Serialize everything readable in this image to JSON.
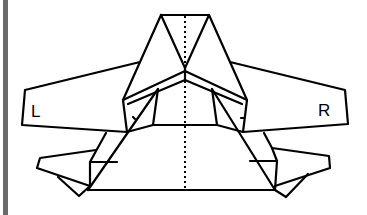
{
  "diagram": {
    "type": "folding-diagram",
    "labels": {
      "left": "L",
      "right": "R"
    },
    "colors": {
      "line": "#000000",
      "background": "#ffffff",
      "left_bar": "#6b6b6b"
    }
  }
}
